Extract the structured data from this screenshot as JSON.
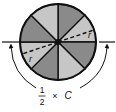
{
  "diagram": {
    "sectors": 8,
    "colors": {
      "light": "#c6c6c6",
      "dark": "#8a8a8a",
      "stroke": "#111111",
      "background": "#ffffff"
    },
    "shading": [
      "dark",
      "light",
      "dark",
      "light",
      "dark",
      "light",
      "dark",
      "light"
    ],
    "radius_labels": [
      {
        "text": "r",
        "position": "right-upper"
      },
      {
        "text": "r",
        "position": "left-lower"
      }
    ],
    "formula": {
      "numerator": "1",
      "denominator": "2",
      "operator": "×",
      "variable": "C"
    }
  }
}
